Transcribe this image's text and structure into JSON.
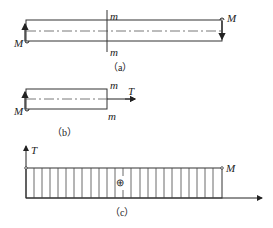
{
  "figure_a": {
    "caption": "（a）",
    "moment_left": "M",
    "moment_right": "M",
    "section_top": "m",
    "section_bottom": "m"
  },
  "figure_b": {
    "caption": "（b）",
    "moment_left": "M",
    "section_top": "m",
    "section_bottom": "m",
    "torque_label": "T"
  },
  "figure_c": {
    "caption": "（c）",
    "axis_label": "T",
    "value_label": "M",
    "sign": "⊕"
  },
  "colors": {
    "line": "#333333",
    "background": "#ffffff"
  }
}
